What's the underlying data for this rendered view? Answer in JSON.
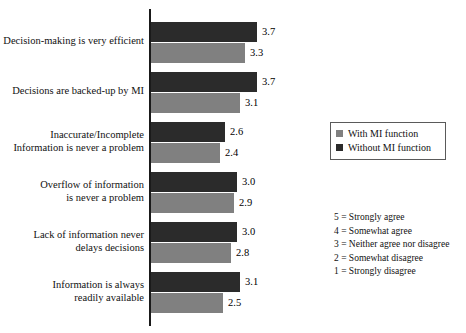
{
  "chart_data": {
    "type": "bar",
    "orientation": "horizontal",
    "title": "",
    "xlabel": "",
    "ylabel": "",
    "xlim": [
      0,
      5
    ],
    "grid": false,
    "legend_position": "right",
    "categories": [
      "Decision-making is very efficient",
      "Decisions are backed-up by MI",
      "Inaccurate/Incomplete\nInformation is never a problem",
      "Overflow of information\nis never a problem",
      "Lack of information never\ndelays decisions",
      "Information is always\nreadily available"
    ],
    "series": [
      {
        "name": "Without MI function",
        "color": "#2b2b2b",
        "values": [
          3.7,
          3.7,
          2.6,
          3.0,
          3.0,
          3.1
        ],
        "labels": [
          "3.7",
          "3.7",
          "2.6",
          "3.0",
          "3.0",
          "3.1"
        ]
      },
      {
        "name": "With MI function",
        "color": "#808080",
        "values": [
          3.3,
          3.1,
          2.4,
          2.9,
          2.8,
          2.5
        ],
        "labels": [
          "3.3",
          "3.1",
          "2.4",
          "2.9",
          "2.8",
          "2.5"
        ]
      }
    ]
  },
  "legend": {
    "items": [
      {
        "label": "With MI function",
        "color": "#808080"
      },
      {
        "label": "Without MI function",
        "color": "#2b2b2b"
      }
    ]
  },
  "scale_key": {
    "lines": [
      "5 = Strongly agree",
      "4 = Somewhat agree",
      "3 = Neither agree nor disagree",
      "2 = Somewhat disagree",
      "1 = Strongly disagree"
    ]
  }
}
